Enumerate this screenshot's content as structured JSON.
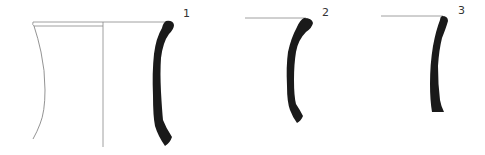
{
  "figure": {
    "profiles": [
      {
        "label": "1",
        "has_full_reconstruction": true
      },
      {
        "label": "2",
        "has_full_reconstruction": false
      },
      {
        "label": "3",
        "has_full_reconstruction": false
      }
    ],
    "colors": {
      "section_fill": "#1a1a1a",
      "line": "#888888",
      "background": "#ffffff"
    }
  }
}
